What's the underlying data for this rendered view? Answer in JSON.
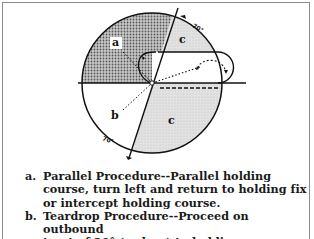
{
  "diagram": {
    "sector_labels": {
      "a": "a",
      "b": "b",
      "c_upper": "c",
      "c_lower": "c"
    },
    "angle_labels": {
      "upper": "70°",
      "lower": "70°"
    },
    "colors": {
      "stipple_dark": "#8c8c8c",
      "shaded_light": "#d6d6d6",
      "line": "#111111"
    }
  },
  "legend": {
    "items": [
      {
        "key": "a.",
        "text": "Parallel Procedure--Parallel holding\ncourse, turn left and return to holding fix\nor intercept holding course."
      },
      {
        "key": "b.",
        "text": "Teardrop Procedure--Proceed on outbound\ntract of 30° (or less) to holding course,"
      }
    ]
  }
}
